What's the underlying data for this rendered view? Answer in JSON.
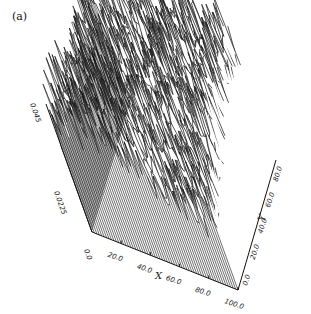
{
  "panel_label": "(a)",
  "chart_data": {
    "type": "surface",
    "title": "",
    "panel": "(a)",
    "xlabel": "X",
    "ylabel": "Y",
    "zlabel": "",
    "x_ticks": [
      "20.0",
      "40.0",
      "60.0",
      "80.0",
      "100.0"
    ],
    "y_ticks": [
      "0.0",
      "20.0",
      "40.0",
      "60.0",
      "80.0"
    ],
    "z_ticks": [
      "0.0",
      "0.0225",
      "0.045"
    ],
    "xlim": [
      0,
      100
    ],
    "ylim": [
      0,
      100
    ],
    "zlim": [
      0,
      0.045
    ],
    "grid": false,
    "legend": null,
    "style": "black wireframe, hidden-line removed, rough random surface with spiky peaks"
  }
}
